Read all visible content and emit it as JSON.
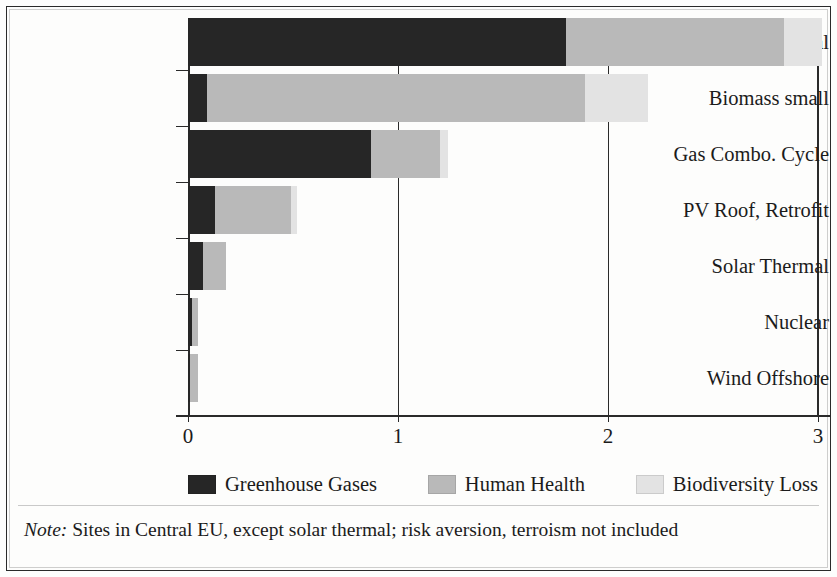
{
  "chart_data": {
    "type": "bar",
    "orientation": "horizontal",
    "stacked": true,
    "title": "",
    "xlabel": "",
    "ylabel": "",
    "xlim": [
      0,
      3
    ],
    "xticks": [
      "0",
      "1",
      "2",
      "3"
    ],
    "grid": true,
    "legend_position": "bottom",
    "categories": [
      "Hard Coal",
      "Biomass small",
      "Gas Combo. Cycle",
      "PV Roof, Retrofit",
      "Solar Thermal",
      "Nuclear",
      "Wind Offshore"
    ],
    "series": [
      {
        "name": "Greenhouse Gases",
        "color": "#262626",
        "values": [
          1.8,
          0.09,
          0.87,
          0.13,
          0.07,
          0.02,
          0.01
        ]
      },
      {
        "name": "Human Health",
        "color": "#b9b9b9",
        "values": [
          1.04,
          1.8,
          0.33,
          0.36,
          0.11,
          0.03,
          0.04
        ]
      },
      {
        "name": "Biodiversity Loss",
        "color": "#e3e3e3",
        "values": [
          0.18,
          0.3,
          0.04,
          0.03,
          0.0,
          0.0,
          0.0
        ]
      }
    ],
    "totals": [
      3.02,
      2.19,
      1.24,
      0.52,
      0.18,
      0.05,
      0.05
    ]
  },
  "legend": {
    "items": [
      {
        "label": "Greenhouse Gases",
        "color": "#262626"
      },
      {
        "label": "Human Health",
        "color": "#b9b9b9"
      },
      {
        "label": "Biodiversity Loss",
        "color": "#e3e3e3"
      }
    ]
  },
  "note": {
    "prefix": "Note:",
    "text": " Sites in Central EU, except solar thermal; risk aversion, terroism not included"
  }
}
